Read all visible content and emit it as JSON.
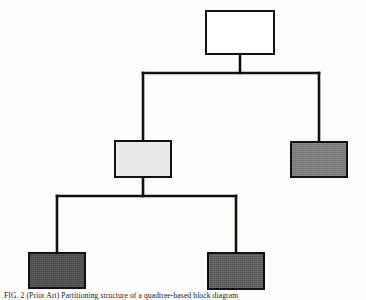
{
  "figure": {
    "type": "hierarchy-tree-diagram",
    "caption": "FIG. 2 (Prior Art) Partitioning structure of a quadtree-based block diagram",
    "caption_visible": "clipped at bottom edge of image",
    "background_color": "#fdfdfc",
    "line_color": "#111111",
    "border_color": "#111111",
    "border_width_px": 2.5
  },
  "nodes": [
    {
      "id": "root",
      "level": 0,
      "label": "",
      "fill_name": "white",
      "fill_color": "#ffffff",
      "x": 205,
      "y": 10,
      "w": 70,
      "h": 45
    },
    {
      "id": "level1-left",
      "level": 1,
      "label": "",
      "fill_name": "light-gray",
      "fill_color": "#e9e9e7",
      "x": 114,
      "y": 140,
      "w": 58,
      "h": 38
    },
    {
      "id": "level1-right",
      "level": 1,
      "label": "",
      "fill_name": "medium-gray",
      "fill_color": "#808080",
      "x": 290,
      "y": 141,
      "w": 58,
      "h": 37
    },
    {
      "id": "level2-left",
      "level": 2,
      "label": "",
      "fill_name": "dark-gray",
      "fill_color": "#4c4c4c",
      "x": 28,
      "y": 252,
      "w": 58,
      "h": 37
    },
    {
      "id": "level2-right",
      "level": 2,
      "label": "",
      "fill_name": "dark-medium-gray",
      "fill_color": "#5e5e5e",
      "x": 207,
      "y": 252,
      "w": 58,
      "h": 38
    }
  ],
  "edges": [
    {
      "from": "root",
      "to": "level1-left",
      "style": "orthogonal"
    },
    {
      "from": "root",
      "to": "level1-right",
      "style": "orthogonal"
    },
    {
      "from": "level1-left",
      "to": "level2-left",
      "style": "orthogonal"
    },
    {
      "from": "level1-left",
      "to": "level2-right",
      "style": "orthogonal"
    }
  ],
  "geometry": {
    "root_stem_x": 240,
    "root_stem_top": 55,
    "bus1_y": 73,
    "bus1_left_x": 143,
    "bus1_right_x": 319,
    "bus2_y": 196,
    "bus2_left_x": 57,
    "bus2_right_x": 236,
    "level1_parent_stem_x": 143
  }
}
